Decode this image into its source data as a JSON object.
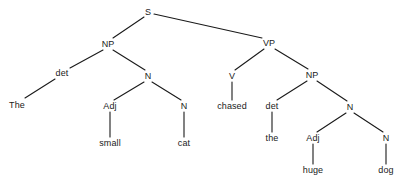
{
  "diagram": {
    "kind": "syntax-parse-tree",
    "sentence": "The small cat chased the huge dog",
    "background_color": "#ffffff",
    "line_color": "#1a1a1a",
    "text_color": "#1a1a1a",
    "nodes": [
      {
        "id": "s",
        "label": "S",
        "x": 148,
        "y": 12,
        "type": "nonterminal"
      },
      {
        "id": "np1",
        "label": "NP",
        "x": 108,
        "y": 44,
        "type": "nonterminal"
      },
      {
        "id": "det1",
        "label": "det",
        "x": 62,
        "y": 73,
        "type": "nonterminal"
      },
      {
        "id": "the1",
        "label": "The",
        "x": 17,
        "y": 105,
        "type": "terminal"
      },
      {
        "id": "n1",
        "label": "N",
        "x": 148,
        "y": 76,
        "type": "nonterminal"
      },
      {
        "id": "adj1",
        "label": "Adj",
        "x": 110,
        "y": 106,
        "type": "nonterminal"
      },
      {
        "id": "small",
        "label": "small",
        "x": 110,
        "y": 143,
        "type": "terminal"
      },
      {
        "id": "n2",
        "label": "N",
        "x": 184,
        "y": 106,
        "type": "nonterminal"
      },
      {
        "id": "cat",
        "label": "cat",
        "x": 184,
        "y": 143,
        "type": "terminal"
      },
      {
        "id": "vp",
        "label": "VP",
        "x": 269,
        "y": 43,
        "type": "nonterminal"
      },
      {
        "id": "v",
        "label": "V",
        "x": 232,
        "y": 76,
        "type": "nonterminal"
      },
      {
        "id": "chased",
        "label": "chased",
        "x": 232,
        "y": 106,
        "type": "terminal"
      },
      {
        "id": "np2",
        "label": "NP",
        "x": 312,
        "y": 75,
        "type": "nonterminal"
      },
      {
        "id": "det2",
        "label": "det",
        "x": 272,
        "y": 106,
        "type": "nonterminal"
      },
      {
        "id": "the2",
        "label": "the",
        "x": 272,
        "y": 138,
        "type": "terminal"
      },
      {
        "id": "n3",
        "label": "N",
        "x": 350,
        "y": 107,
        "type": "nonterminal"
      },
      {
        "id": "adj2",
        "label": "Adj",
        "x": 313,
        "y": 138,
        "type": "nonterminal"
      },
      {
        "id": "huge",
        "label": "huge",
        "x": 313,
        "y": 170,
        "type": "terminal"
      },
      {
        "id": "n4",
        "label": "N",
        "x": 386,
        "y": 138,
        "type": "nonterminal"
      },
      {
        "id": "dog",
        "label": "dog",
        "x": 386,
        "y": 170,
        "type": "terminal"
      }
    ],
    "edges": [
      {
        "from": "s",
        "to": "np1",
        "x1": 144,
        "y1": 17,
        "x2": 113,
        "y2": 38
      },
      {
        "from": "s",
        "to": "vp",
        "x1": 154,
        "y1": 14,
        "x2": 262,
        "y2": 38
      },
      {
        "from": "np1",
        "to": "det1",
        "x1": 103,
        "y1": 50,
        "x2": 70,
        "y2": 68
      },
      {
        "from": "det1",
        "to": "the1",
        "x1": 55,
        "y1": 79,
        "x2": 25,
        "y2": 98
      },
      {
        "from": "np1",
        "to": "n1",
        "x1": 113,
        "y1": 50,
        "x2": 145,
        "y2": 70
      },
      {
        "from": "n1",
        "to": "adj1",
        "x1": 144,
        "y1": 82,
        "x2": 114,
        "y2": 100
      },
      {
        "from": "adj1",
        "to": "small",
        "x1": 110,
        "y1": 112,
        "x2": 110,
        "y2": 137
      },
      {
        "from": "n1",
        "to": "n2",
        "x1": 152,
        "y1": 82,
        "x2": 181,
        "y2": 100
      },
      {
        "from": "n2",
        "to": "cat",
        "x1": 184,
        "y1": 112,
        "x2": 184,
        "y2": 137
      },
      {
        "from": "vp",
        "to": "v",
        "x1": 264,
        "y1": 49,
        "x2": 235,
        "y2": 70
      },
      {
        "from": "v",
        "to": "chased",
        "x1": 232,
        "y1": 82,
        "x2": 232,
        "y2": 100
      },
      {
        "from": "vp",
        "to": "np2",
        "x1": 275,
        "y1": 49,
        "x2": 308,
        "y2": 69
      },
      {
        "from": "np2",
        "to": "det2",
        "x1": 307,
        "y1": 81,
        "x2": 277,
        "y2": 100
      },
      {
        "from": "det2",
        "to": "the2",
        "x1": 272,
        "y1": 112,
        "x2": 272,
        "y2": 132
      },
      {
        "from": "np2",
        "to": "n3",
        "x1": 317,
        "y1": 81,
        "x2": 347,
        "y2": 101
      },
      {
        "from": "n3",
        "to": "adj2",
        "x1": 346,
        "y1": 113,
        "x2": 317,
        "y2": 132
      },
      {
        "from": "adj2",
        "to": "huge",
        "x1": 313,
        "y1": 144,
        "x2": 313,
        "y2": 164
      },
      {
        "from": "n3",
        "to": "n4",
        "x1": 354,
        "y1": 113,
        "x2": 383,
        "y2": 132
      },
      {
        "from": "n4",
        "to": "dog",
        "x1": 386,
        "y1": 144,
        "x2": 386,
        "y2": 164
      }
    ]
  }
}
